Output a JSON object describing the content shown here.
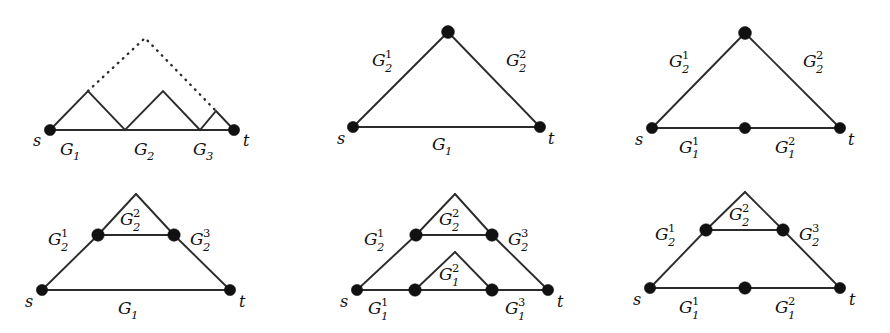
{
  "figure": {
    "background_color": "#ffffff",
    "line_color": "#2b2b2b",
    "node_color": "#111111",
    "width": 890,
    "height": 333
  },
  "panels": [
    {
      "id": "panel-1",
      "position": "top-left",
      "description": "Chain of series subgraphs G1 G2 G3 from s to t with dotted enclosing arc",
      "terminals": {
        "source": "s",
        "sink": "t"
      },
      "edge_labels": [
        {
          "name": "G1",
          "base": "G",
          "sub": "1",
          "sup": ""
        },
        {
          "name": "G2",
          "base": "G",
          "sub": "2",
          "sup": ""
        },
        {
          "name": "G3",
          "base": "G",
          "sub": "3",
          "sup": ""
        }
      ],
      "has_dotted_edge": true,
      "node_count": 2
    },
    {
      "id": "panel-2",
      "position": "top-middle",
      "description": "Triangle: bottom edge G1, upper path split into G2^1 and G2^2",
      "terminals": {
        "source": "s",
        "sink": "t"
      },
      "edge_labels": [
        {
          "name": "G2^1",
          "base": "G",
          "sub": "2",
          "sup": "1"
        },
        {
          "name": "G2^2",
          "base": "G",
          "sub": "2",
          "sup": "2"
        },
        {
          "name": "G1",
          "base": "G",
          "sub": "1",
          "sup": ""
        }
      ],
      "has_dotted_edge": false,
      "node_count": 3
    },
    {
      "id": "panel-3",
      "position": "top-right",
      "description": "Triangle with bottom edge split into G1^1 and G1^2, upper path G2^1 and G2^2",
      "terminals": {
        "source": "s",
        "sink": "t"
      },
      "edge_labels": [
        {
          "name": "G2^1",
          "base": "G",
          "sub": "2",
          "sup": "1"
        },
        {
          "name": "G2^2",
          "base": "G",
          "sub": "2",
          "sup": "2"
        },
        {
          "name": "G1^1",
          "base": "G",
          "sub": "1",
          "sup": "1"
        },
        {
          "name": "G1^2",
          "base": "G",
          "sub": "1",
          "sup": "2"
        }
      ],
      "has_dotted_edge": false,
      "node_count": 4
    },
    {
      "id": "panel-4",
      "position": "bottom-left",
      "description": "Trapezoid with apex triangle: upper path G2^1 G2^2 G2^3, bottom edge G1",
      "terminals": {
        "source": "s",
        "sink": "t"
      },
      "edge_labels": [
        {
          "name": "G2^1",
          "base": "G",
          "sub": "2",
          "sup": "1"
        },
        {
          "name": "G2^2",
          "base": "G",
          "sub": "2",
          "sup": "2"
        },
        {
          "name": "G2^3",
          "base": "G",
          "sub": "2",
          "sup": "3"
        },
        {
          "name": "G1",
          "base": "G",
          "sub": "1",
          "sup": ""
        }
      ],
      "has_dotted_edge": false,
      "node_count": 4
    },
    {
      "id": "panel-5",
      "position": "bottom-middle",
      "description": "Two nested trapezoids: upper path G2^1 G2^2 G2^3, lower path G1^1 G1^2 G1^3",
      "terminals": {
        "source": "s",
        "sink": "t"
      },
      "edge_labels": [
        {
          "name": "G2^1",
          "base": "G",
          "sub": "2",
          "sup": "1"
        },
        {
          "name": "G2^2",
          "base": "G",
          "sub": "2",
          "sup": "2"
        },
        {
          "name": "G2^3",
          "base": "G",
          "sub": "2",
          "sup": "3"
        },
        {
          "name": "G1^1",
          "base": "G",
          "sub": "1",
          "sup": "1"
        },
        {
          "name": "G1^2",
          "base": "G",
          "sub": "1",
          "sup": "2"
        },
        {
          "name": "G1^3",
          "base": "G",
          "sub": "1",
          "sup": "3"
        }
      ],
      "has_dotted_edge": false,
      "node_count": 6
    },
    {
      "id": "panel-6",
      "position": "bottom-right",
      "description": "Trapezoid with apex triangle and bottom edge split: upper path G2^1 G2^2 G2^3, bottom G1^1 G1^2",
      "terminals": {
        "source": "s",
        "sink": "t"
      },
      "edge_labels": [
        {
          "name": "G2^1",
          "base": "G",
          "sub": "2",
          "sup": "1"
        },
        {
          "name": "G2^2",
          "base": "G",
          "sub": "2",
          "sup": "2"
        },
        {
          "name": "G2^3",
          "base": "G",
          "sub": "2",
          "sup": "3"
        },
        {
          "name": "G1^1",
          "base": "G",
          "sub": "1",
          "sup": "1"
        },
        {
          "name": "G1^2",
          "base": "G",
          "sub": "1",
          "sup": "2"
        }
      ],
      "has_dotted_edge": false,
      "node_count": 5
    }
  ],
  "labels": {
    "s": "s",
    "t": "t",
    "G": "G",
    "sub1": "1",
    "sub2": "2",
    "sub3": "3",
    "sup1": "1",
    "sup2": "2",
    "sup3": "3"
  }
}
